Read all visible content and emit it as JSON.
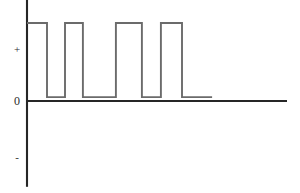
{
  "figure": {
    "title": "",
    "background_color": "#ffffff",
    "axis_color": "#262626",
    "signal_color": "#6b6b6b",
    "labels": {
      "plus": "+",
      "zero": "0",
      "minus": "-"
    }
  },
  "chart_data": {
    "type": "line",
    "title": "",
    "xlabel": "",
    "ylabel": "",
    "grid": false,
    "legend": null,
    "annotations": [],
    "y_ticks": [
      {
        "label": "+",
        "value": 1
      },
      {
        "label": "0",
        "value": 0
      },
      {
        "label": "-",
        "value": -1
      }
    ],
    "x_ticks": [],
    "xlim": [
      0,
      100
    ],
    "ylim": [
      -1.1,
      1.35
    ],
    "axes": {
      "x_axis_y_value": 0,
      "x_axis_from": 0,
      "x_axis_to": 100,
      "y_axis_x_value": 0,
      "y_axis_from": -1.1,
      "y_axis_to": 1.35
    },
    "series": [
      {
        "name": "pulse-train",
        "style": "step",
        "high_level": 1.0,
        "low_level": 0.05,
        "x": [
          0,
          7.7,
          7.7,
          14.6,
          14.6,
          21.5,
          21.5,
          34.2,
          34.2,
          44.2,
          44.2,
          51.5,
          51.5,
          59.6,
          59.6,
          71.2
        ],
        "y": [
          1.0,
          1.0,
          0.05,
          0.05,
          1.0,
          1.0,
          0.05,
          0.05,
          1.0,
          1.0,
          0.05,
          0.05,
          1.0,
          1.0,
          0.05,
          0.05
        ],
        "pulse_count": 4,
        "ends_low_at_x": 71.2
      }
    ]
  }
}
